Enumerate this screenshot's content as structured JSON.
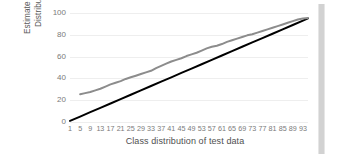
{
  "chart_data": {
    "type": "line",
    "title": "",
    "xlabel": "Class distribution of test data",
    "ylabel": "Estimate Class Distribution",
    "ylabel_lines": [
      "Estimate Class",
      "Distribution"
    ],
    "xlim": [
      1,
      95
    ],
    "ylim": [
      0,
      100
    ],
    "grid": true,
    "legend": "none",
    "y_ticks": [
      0,
      20,
      40,
      60,
      80,
      100
    ],
    "y_tick_labels": [
      "0",
      "20",
      "40",
      "60",
      "80",
      "100"
    ],
    "x_tick_labels": [
      "1",
      "5",
      "9",
      "13",
      "17",
      "21",
      "25",
      "29",
      "33",
      "37",
      "41",
      "45",
      "49",
      "53",
      "57",
      "61",
      "65",
      "69",
      "73",
      "77",
      "81",
      "85",
      "89",
      "93"
    ],
    "x_tick_values": [
      1,
      5,
      9,
      13,
      17,
      21,
      25,
      29,
      33,
      37,
      41,
      45,
      49,
      53,
      57,
      61,
      65,
      69,
      73,
      77,
      81,
      85,
      89,
      93
    ],
    "series": [
      {
        "name": "ideal",
        "color": "#000000",
        "width": 2.0,
        "x": [
          1,
          5,
          9,
          13,
          17,
          21,
          25,
          29,
          33,
          37,
          41,
          45,
          49,
          53,
          57,
          61,
          65,
          69,
          73,
          77,
          81,
          85,
          89,
          93,
          95
        ],
        "values": [
          1,
          5,
          9,
          13,
          17,
          21,
          25,
          29,
          33,
          37,
          41,
          45,
          49,
          53,
          57,
          61,
          65,
          69,
          73,
          77,
          81,
          85,
          89,
          93,
          95
        ]
      },
      {
        "name": "estimate",
        "color": "#8c8c8c",
        "width": 2.0,
        "x": [
          5,
          7,
          9,
          11,
          13,
          15,
          17,
          19,
          21,
          23,
          25,
          27,
          29,
          31,
          33,
          35,
          37,
          39,
          41,
          43,
          45,
          47,
          49,
          51,
          53,
          55,
          57,
          59,
          61,
          63,
          65,
          67,
          69,
          71,
          73,
          75,
          77,
          79,
          81,
          83,
          85,
          87,
          89,
          91,
          93,
          95
        ],
        "values": [
          25.5,
          26.5,
          27.5,
          29.0,
          30.5,
          32.5,
          34.5,
          36.0,
          37.5,
          39.5,
          41.0,
          42.5,
          44.0,
          45.5,
          47.0,
          49.5,
          51.5,
          53.5,
          55.5,
          57.0,
          58.5,
          60.5,
          62.0,
          63.5,
          65.5,
          67.5,
          69.0,
          70.0,
          71.5,
          73.5,
          75.0,
          76.5,
          78.0,
          79.5,
          80.5,
          82.0,
          83.5,
          85.0,
          86.5,
          88.0,
          89.5,
          91.0,
          92.5,
          94.0,
          95.0,
          95.5
        ]
      }
    ]
  },
  "chart": {
    "right_scrollbar_color": "#d2d2d2",
    "gridline_color": "#eeeeee",
    "tick_label_color": "#7a7a7a",
    "axis_title_color": "#4f4f4f"
  }
}
